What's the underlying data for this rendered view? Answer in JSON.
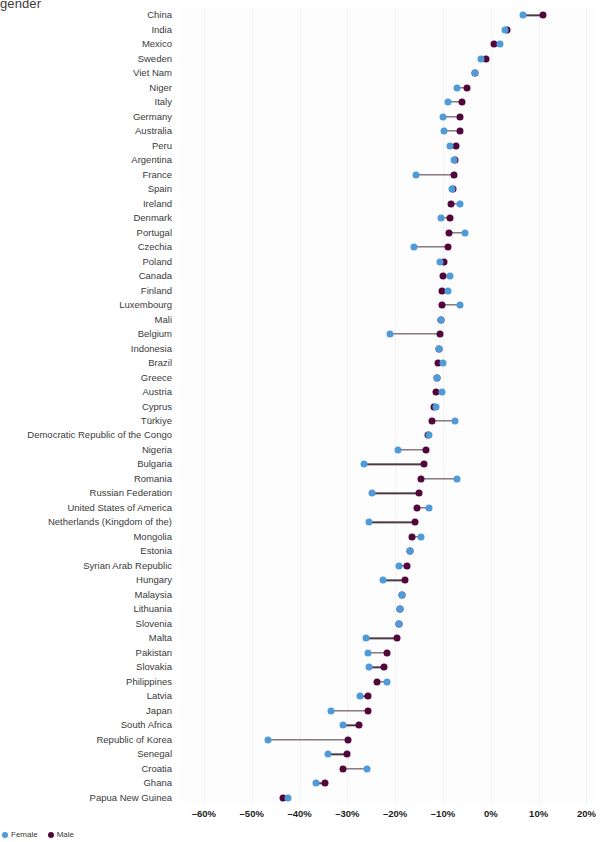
{
  "chart_data": {
    "type": "scatter",
    "subtype": "dumbbell",
    "title": "gender",
    "xlabel": "",
    "ylabel": "",
    "xlim": [
      -65,
      22
    ],
    "grid": true,
    "legend_position": "bottom-left",
    "tick_labels": [
      "–60%",
      "–50%",
      "–40%",
      "–30%",
      "–20%",
      "–10%",
      "0%",
      "10%",
      "20%"
    ],
    "tick_values": [
      -60,
      -50,
      -40,
      -30,
      -20,
      -10,
      0,
      10,
      20
    ],
    "series": [
      {
        "name": "Female",
        "color": "#4f9ad8"
      },
      {
        "name": "Male",
        "color": "#52073c"
      }
    ],
    "categories": [
      "China",
      "India",
      "Mexico",
      "Sweden",
      "Viet Nam",
      "Niger",
      "Italy",
      "Germany",
      "Australia",
      "Peru",
      "Argentina",
      "France",
      "Spain",
      "Ireland",
      "Denmark",
      "Portugal",
      "Czechia",
      "Poland",
      "Canada",
      "Finland",
      "Luxembourg",
      "Mali",
      "Belgium",
      "Indonesia",
      "Brazil",
      "Greece",
      "Austria",
      "Cyprus",
      "Türkiye",
      "Democratic Republic of the Congo",
      "Nigeria",
      "Bulgaria",
      "Romania",
      "Russian Federation",
      "United States of America",
      "Netherlands (Kingdom of the)",
      "Mongolia",
      "Estonia",
      "Syrian Arab Republic",
      "Hungary",
      "Malaysia",
      "Lithuania",
      "Slovenia",
      "Malta",
      "Pakistan",
      "Slovakia",
      "Philippines",
      "Latvia",
      "Japan",
      "South Africa",
      "Republic of Korea",
      "Senegal",
      "Croatia",
      "Ghana",
      "Papua New Guinea"
    ],
    "points": [
      {
        "country": "China",
        "female": 6.7,
        "male": 11.0
      },
      {
        "country": "India",
        "female": 3.0,
        "male": 3.3
      },
      {
        "country": "Mexico",
        "female": 2.0,
        "male": 0.6
      },
      {
        "country": "Sweden",
        "female": -2.0,
        "male": -1.0
      },
      {
        "country": "Viet Nam",
        "female": -3.4,
        "male": -3.4
      },
      {
        "country": "Niger",
        "female": -7.0,
        "male": -5.0
      },
      {
        "country": "Italy",
        "female": -9.0,
        "male": -6.0
      },
      {
        "country": "Germany",
        "female": -10.0,
        "male": -6.4
      },
      {
        "country": "Australia",
        "female": -9.7,
        "male": -6.4
      },
      {
        "country": "Peru",
        "female": -8.6,
        "male": -7.2
      },
      {
        "country": "Argentina",
        "female": -7.6,
        "male": -7.4
      },
      {
        "country": "France",
        "female": -15.6,
        "male": -7.6
      },
      {
        "country": "Spain",
        "female": -8.2,
        "male": -8.0
      },
      {
        "country": "Ireland",
        "female": -6.5,
        "male": -8.3
      },
      {
        "country": "Denmark",
        "female": -10.5,
        "male": -8.5
      },
      {
        "country": "Portugal",
        "female": -5.5,
        "male": -8.8
      },
      {
        "country": "Czechia",
        "female": -16.0,
        "male": -9.0
      },
      {
        "country": "Poland",
        "female": -10.6,
        "male": -9.8
      },
      {
        "country": "Canada",
        "female": -8.6,
        "male": -9.9
      },
      {
        "country": "Finland",
        "female": -8.9,
        "male": -10.2
      },
      {
        "country": "Luxembourg",
        "female": -6.4,
        "male": -10.3
      },
      {
        "country": "Mali",
        "female": -10.5,
        "male": -10.5
      },
      {
        "country": "Belgium",
        "female": -21.0,
        "male": -10.6
      },
      {
        "country": "Indonesia",
        "female": -10.8,
        "male": -10.8
      },
      {
        "country": "Brazil",
        "female": -10.1,
        "male": -11.0
      },
      {
        "country": "Greece",
        "female": -11.2,
        "male": -11.2
      },
      {
        "country": "Austria",
        "female": -10.2,
        "male": -11.4
      },
      {
        "country": "Cyprus",
        "female": -11.4,
        "male": -11.8
      },
      {
        "country": "Türkiye",
        "female": -7.5,
        "male": -12.3
      },
      {
        "country": "Democratic Republic of the Congo",
        "female": -13.0,
        "male": -13.1
      },
      {
        "country": "Nigeria",
        "female": -19.5,
        "male": -13.6
      },
      {
        "country": "Bulgaria",
        "female": -26.5,
        "male": -14.0
      },
      {
        "country": "Romania",
        "female": -7.0,
        "male": -14.5
      },
      {
        "country": "Russian Federation",
        "female": -24.8,
        "male": -15.0
      },
      {
        "country": "United States of America",
        "female": -13.0,
        "male": -15.4
      },
      {
        "country": "Netherlands (Kingdom of the)",
        "female": -25.4,
        "male": -15.8
      },
      {
        "country": "Mongolia",
        "female": -14.5,
        "male": -16.4
      },
      {
        "country": "Estonia",
        "female": -16.8,
        "male": -17.0
      },
      {
        "country": "Syrian Arab Republic",
        "female": -19.2,
        "male": -17.6
      },
      {
        "country": "Hungary",
        "female": -22.6,
        "male": -18.0
      },
      {
        "country": "Malaysia",
        "female": -18.5,
        "male": -18.5
      },
      {
        "country": "Lithuania",
        "female": -18.9,
        "male": -18.9
      },
      {
        "country": "Slovenia",
        "female": -19.2,
        "male": -19.2
      },
      {
        "country": "Malta",
        "female": -26.0,
        "male": -19.6
      },
      {
        "country": "Pakistan",
        "female": -25.6,
        "male": -21.8
      },
      {
        "country": "Slovakia",
        "female": -25.5,
        "male": -22.4
      },
      {
        "country": "Philippines",
        "female": -21.8,
        "male": -23.8
      },
      {
        "country": "Latvia",
        "female": -27.4,
        "male": -25.6
      },
      {
        "country": "Japan",
        "female": -33.5,
        "male": -25.7
      },
      {
        "country": "South Africa",
        "female": -31.0,
        "male": -27.5
      },
      {
        "country": "Republic of Korea",
        "female": -46.5,
        "male": -29.8
      },
      {
        "country": "Senegal",
        "female": -34.0,
        "male": -30.0
      },
      {
        "country": "Croatia",
        "female": -25.9,
        "male": -31.0
      },
      {
        "country": "Ghana",
        "female": -36.5,
        "male": -34.7
      },
      {
        "country": "Papua New Guinea",
        "female": -42.5,
        "male": -43.5
      }
    ]
  },
  "legend": {
    "items": [
      {
        "label": "Female",
        "color": "#4f9ad8"
      },
      {
        "label": "Male",
        "color": "#52073c"
      }
    ]
  }
}
